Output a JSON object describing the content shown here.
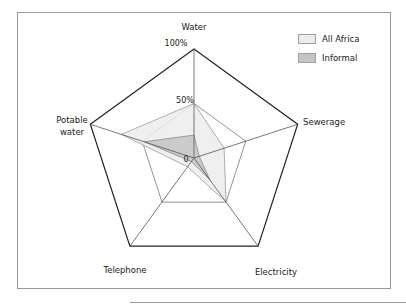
{
  "chart_data": {
    "type": "radar",
    "title": "",
    "axes": [
      "Water",
      "Sewerage",
      "Electricity",
      "Telephone",
      "Potable water"
    ],
    "axis_labels_display": [
      "Water",
      "Sewerage",
      "Electricity",
      "Telephone",
      "Potable",
      "water"
    ],
    "tick_labels": [
      "0",
      "50%",
      "100%"
    ],
    "range": [
      0,
      100
    ],
    "gridlines": [
      50,
      100
    ],
    "legend_position": "top-right",
    "series": [
      {
        "name": "All Africa",
        "color": "#ececec",
        "stroke": "#9a9a9a",
        "values": [
          50,
          29,
          50,
          10,
          70
        ]
      },
      {
        "name": "Informal",
        "color": "#c4c4c4",
        "stroke": "#8a8a8a",
        "values": [
          21,
          5,
          25,
          4,
          48
        ]
      }
    ]
  },
  "labels": {
    "water": "Water",
    "sewerage": "Sewerage",
    "electricity": "Electricity",
    "telephone": "Telephone",
    "potable_1": "Potable",
    "potable_2": "water",
    "tick_0": "0",
    "tick_50": "50%",
    "tick_100": "100%"
  },
  "legend": {
    "items": [
      {
        "label": "All Africa",
        "color": "#ececec"
      },
      {
        "label": "Informal",
        "color": "#c4c4c4"
      }
    ]
  }
}
